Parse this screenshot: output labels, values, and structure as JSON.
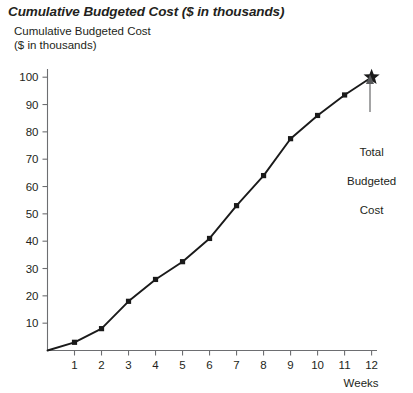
{
  "chart_data": {
    "type": "line",
    "title": "Cumulative Budgeted Cost ($ in thousands)",
    "ylabel": "Cumulative Budgeted Cost\n($ in thousands)",
    "ylabel_line1": "Cumulative Budgeted Cost",
    "ylabel_line2": "($ in thousands)",
    "xlabel": "Weeks",
    "x": [
      0,
      1,
      2,
      3,
      4,
      5,
      6,
      7,
      8,
      9,
      10,
      11,
      12
    ],
    "categories": [
      "0",
      "1",
      "2",
      "3",
      "4",
      "5",
      "6",
      "7",
      "8",
      "9",
      "10",
      "11",
      "12"
    ],
    "values": [
      0,
      3,
      8,
      18,
      26,
      32.5,
      41,
      53,
      64,
      77.5,
      86,
      93.5,
      100
    ],
    "series": [
      {
        "name": "Cumulative Budgeted Cost",
        "values": [
          0,
          3,
          8,
          18,
          26,
          32.5,
          41,
          53,
          64,
          77.5,
          86,
          93.5,
          100
        ]
      }
    ],
    "xlim": [
      0,
      12.2
    ],
    "ylim": [
      0,
      103
    ],
    "yticks": [
      10,
      20,
      30,
      40,
      50,
      60,
      70,
      80,
      90,
      100
    ],
    "ytick_labels": [
      "10",
      "20",
      "30",
      "40",
      "50",
      "60",
      "70",
      "80",
      "90",
      "100"
    ],
    "xticks": [
      1,
      2,
      3,
      4,
      5,
      6,
      7,
      8,
      9,
      10,
      11,
      12
    ],
    "xtick_labels": [
      "1",
      "2",
      "3",
      "4",
      "5",
      "6",
      "7",
      "8",
      "9",
      "10",
      "11",
      "12"
    ],
    "grid": false,
    "legend": false,
    "marker": "square",
    "final_marker": "star",
    "annotations": [
      {
        "text": "Total\nBudgeted\nCost",
        "text_line1": "Total",
        "text_line2": "Budgeted",
        "text_line3": "Cost",
        "points_to_x": 12,
        "points_to_y": 100
      }
    ],
    "colors": {
      "line": "#1a1a1a",
      "marker": "#1a1a1a",
      "axis": "#6d6e71",
      "text": "#231f20",
      "annotation_arrow": "#58595b",
      "background": "#ffffff"
    }
  }
}
